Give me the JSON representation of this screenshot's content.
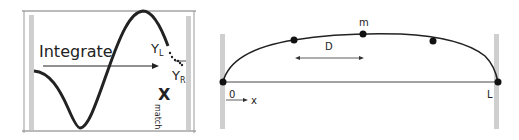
{
  "left_panel": {
    "integrate_label": "Integrate",
    "yl_main": "Y",
    "yl_sub": "L",
    "yr_main": "Y",
    "yr_sub": "R",
    "xmatch_main": "X",
    "xmatch_sub": "match"
  },
  "right_panel": {
    "m_label": "m",
    "d_label": "D",
    "origin_label": "0",
    "x_label": "x",
    "end_label": "L"
  },
  "colors": {
    "bar": "#cfcfcf",
    "line": "#222222",
    "box": "#555555"
  }
}
